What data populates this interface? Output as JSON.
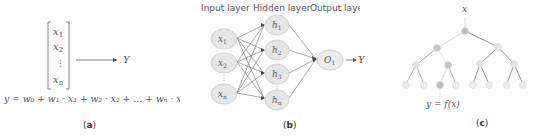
{
  "panel_a": {
    "inputs": [
      "x",
      "x",
      "x"
    ],
    "input_subs": [
      "1",
      "2",
      "n"
    ],
    "dots": "⋮",
    "output": "Y",
    "equation": "y = w₀ + w₁ · x₁ + w₂ · x₂ + … + wₙ · xₙ",
    "caption_open": "(",
    "caption_letter": "a",
    "caption_close": ")"
  },
  "panel_b": {
    "layer_labels": [
      "Input layer",
      "Hidden layer",
      "Output layer"
    ],
    "input_nodes": [
      {
        "base": "x",
        "sub": "1"
      },
      {
        "base": "x",
        "sub": "2"
      },
      {
        "base": "x",
        "sub": "n"
      }
    ],
    "hidden_nodes": [
      {
        "base": "h",
        "sub": "1"
      },
      {
        "base": "h",
        "sub": "2"
      },
      {
        "base": "h",
        "sub": "3"
      },
      {
        "base": "h",
        "sub": "n"
      }
    ],
    "output_node": {
      "base": "O",
      "sub": "1"
    },
    "output": "Y",
    "caption_open": "(",
    "caption_letter": "b",
    "caption_close": ")"
  },
  "panel_c": {
    "root_label": "x",
    "leaf_label": "y = f(x)",
    "caption_open": "(",
    "caption_letter": "c",
    "caption_close": ")"
  },
  "colors": {
    "node_fill": "#e6e6e6",
    "node_stroke": "#cfcfcf",
    "edge": "#555555",
    "path_node": "#bdbdbd",
    "path_edge": "#d8d8d8",
    "tree_node": "#e4e4e4"
  }
}
